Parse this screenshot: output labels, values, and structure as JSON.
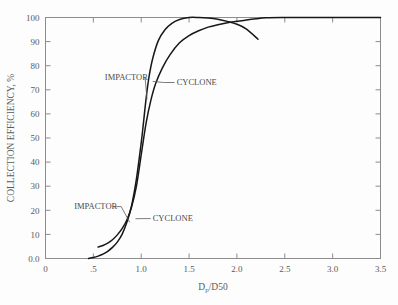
{
  "chart_data": {
    "type": "line",
    "title": "",
    "xlabel": "Dp/D50",
    "xlabel_base": "D",
    "xlabel_sub": "p",
    "xlabel_rest": "/D50",
    "ylabel": "COLLECTION EFFICIENCY, %",
    "xlim": [
      0,
      3.5
    ],
    "ylim": [
      0,
      100
    ],
    "grid": false,
    "legend_position": "inline-annotations",
    "xticks": [
      "0",
      ".5",
      "1.0",
      "1.5",
      "2.0",
      "2.5",
      "3.0",
      "3.5"
    ],
    "xtick_values": [
      0,
      0.5,
      1.0,
      1.5,
      2.0,
      2.5,
      3.0,
      3.5
    ],
    "yticks": [
      "0.0",
      "10",
      "20",
      "30",
      "40",
      "50",
      "60",
      "70",
      "80",
      "90",
      "100"
    ],
    "ytick_values": [
      0,
      10,
      20,
      30,
      40,
      50,
      60,
      70,
      80,
      90,
      100
    ],
    "series": [
      {
        "name": "IMPACTOR",
        "x": [
          0.45,
          0.5,
          0.55,
          0.6,
          0.65,
          0.7,
          0.75,
          0.8,
          0.85,
          0.9,
          0.95,
          1.0,
          1.02,
          1.05,
          1.08,
          1.12,
          1.18,
          1.25,
          1.32,
          1.4,
          1.5,
          1.6,
          1.7,
          1.8,
          1.9,
          2.0,
          2.1,
          2.22
        ],
        "y": [
          0.0,
          0.4,
          1.0,
          1.8,
          3.0,
          4.6,
          6.8,
          10.0,
          15.0,
          22.0,
          33.0,
          48.0,
          55.0,
          66.0,
          75.0,
          83.0,
          90.5,
          95.0,
          97.6,
          99.2,
          100.0,
          100.0,
          99.8,
          99.3,
          98.4,
          97.2,
          95.2,
          91.0
        ]
      },
      {
        "name": "CYCLONE",
        "x": [
          0.55,
          0.6,
          0.65,
          0.7,
          0.75,
          0.8,
          0.85,
          0.9,
          0.95,
          1.0,
          1.05,
          1.1,
          1.15,
          1.22,
          1.3,
          1.4,
          1.5,
          1.6,
          1.7,
          1.8,
          1.9,
          2.0,
          2.1,
          2.2,
          2.3,
          2.5,
          2.8,
          3.1,
          3.4,
          3.5
        ],
        "y": [
          4.8,
          5.4,
          6.4,
          7.8,
          9.8,
          12.4,
          16.0,
          21.5,
          30.0,
          43.0,
          56.0,
          65.5,
          72.5,
          79.0,
          84.5,
          89.5,
          92.5,
          94.5,
          96.0,
          97.0,
          97.8,
          98.4,
          99.0,
          99.5,
          99.9,
          100.0,
          100.0,
          100.0,
          100.0,
          100.0
        ]
      }
    ],
    "annotations": [
      {
        "id": "impactor-upper",
        "label": "IMPACTOR",
        "text_x": 0.62,
        "text_y": 74.0,
        "leader_to_x": 1.06,
        "leader_to_y": 66.0
      },
      {
        "id": "cyclone-upper",
        "label": "CYCLONE",
        "text_x": 1.37,
        "text_y": 72.0,
        "leader_to_x": 1.12,
        "leader_to_y": 73.5
      },
      {
        "id": "impactor-lower",
        "label": "IMPACTOR",
        "text_x": 0.3,
        "text_y": 20.5,
        "leader_to_x": 0.88,
        "leader_to_y": 15.0
      },
      {
        "id": "cyclone-lower",
        "label": "CYCLONE",
        "text_x": 1.12,
        "text_y": 15.5,
        "leader_to_x": 0.94,
        "leader_to_y": 16.5
      }
    ],
    "colors": {
      "background": "#fdfdfd",
      "curve": "#171717",
      "axis": "#8c8c8c",
      "text": "#5a5a5a"
    }
  }
}
